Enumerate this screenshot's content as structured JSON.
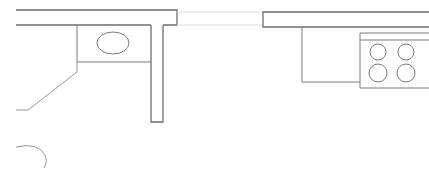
{
  "drawing": {
    "title": "Kitchen floor plan (partial)",
    "type": "architectural-plan",
    "colors": {
      "line": "#6e6e6e",
      "fixture": "#7a7a7a",
      "window": "#dcdcdc",
      "background": "#ffffff"
    },
    "elements": [
      {
        "name": "top-wall-left",
        "kind": "wall"
      },
      {
        "name": "wall-stub",
        "kind": "wall"
      },
      {
        "name": "window-opening",
        "kind": "window"
      },
      {
        "name": "top-wall-right",
        "kind": "wall"
      },
      {
        "name": "sink-counter",
        "kind": "counter"
      },
      {
        "name": "sink-basin",
        "kind": "sink",
        "shape": "oval"
      },
      {
        "name": "angled-counter",
        "kind": "counter"
      },
      {
        "name": "cabinet",
        "kind": "counter"
      },
      {
        "name": "stove",
        "kind": "appliance",
        "burners": 4
      },
      {
        "name": "door-swing-arc",
        "kind": "door"
      }
    ]
  }
}
